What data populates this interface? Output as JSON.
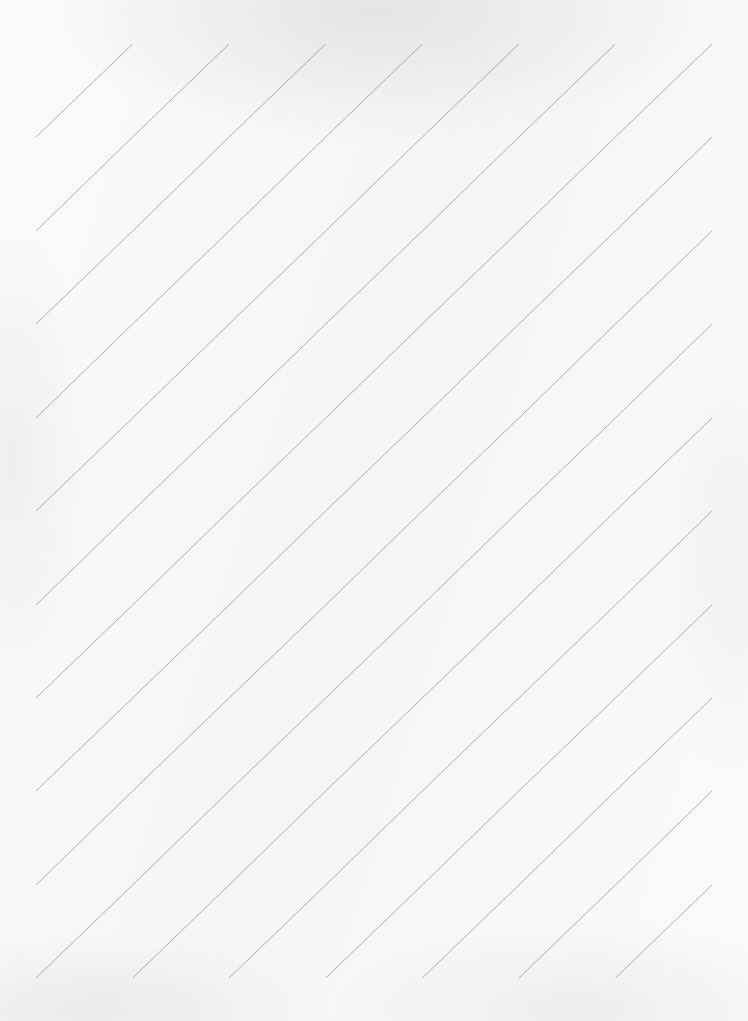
{
  "sheet": {
    "title": "Calligraphy Slant Practice Grid",
    "description": "Blank lettering practice sheet: ruled bands with ascender, x-height and descender guides plus 45-degree slant lines",
    "page_width": 748,
    "page_height": 1021,
    "background_color": "#f6f6f5"
  },
  "chart_data": {
    "type": "table",
    "title": "Calligraphy Slant Practice Grid",
    "xlabel": "",
    "ylabel": "",
    "grid": true,
    "legend_position": "none",
    "columns": 7,
    "rows": 10,
    "cells_total": 70,
    "sub_rows_per_band": 3,
    "categories": [
      "col-1",
      "col-2",
      "col-3",
      "col-4",
      "col-5",
      "col-6",
      "col-7"
    ],
    "values": [
      10,
      10,
      10,
      10,
      10,
      10,
      10
    ],
    "geometry": {
      "grid_left": 36,
      "grid_right": 712,
      "grid_top": 44,
      "grid_bottom": 978,
      "column_width": 96.57,
      "band_height": 93.4,
      "vertical_lines_x": [
        36,
        132.6,
        229.1,
        325.7,
        422.3,
        518.9,
        615.4,
        712
      ],
      "band_top_lines_y": [
        44,
        137,
        231,
        324,
        418,
        511,
        605,
        698,
        791,
        885,
        978
      ],
      "sub_row_fractions": [
        0.41,
        0.305,
        0.285
      ],
      "diagonal_direction": "bottom-left-to-top-right"
    },
    "colors": {
      "band_line": "#2d2d2d",
      "sub_line": "#9d9d9d",
      "diagonal_line": "#8d8d8d",
      "vertical_line": "#7e7e7e",
      "paper": "#f6f6f5"
    },
    "line_widths": {
      "band_line": 1.7,
      "sub_line": 0.75,
      "diagonal_line": 0.75,
      "vertical_line": 0.75
    }
  }
}
